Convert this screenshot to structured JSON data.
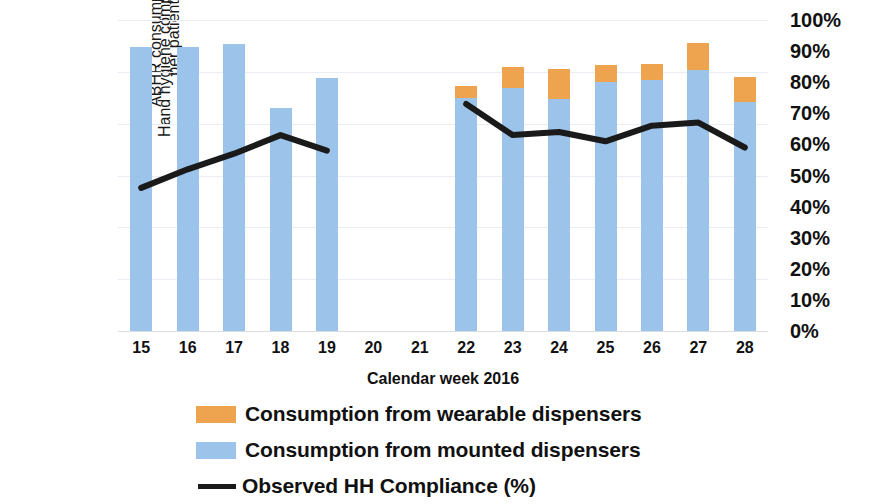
{
  "chart_data": {
    "type": "bar",
    "title": "",
    "xlabel": "Calendar week 2016",
    "categories": [
      "15",
      "16",
      "17",
      "18",
      "19",
      "20",
      "21",
      "22",
      "23",
      "24",
      "25",
      "26",
      "27",
      "28"
    ],
    "left_axis": {
      "label": "ABHR consumption in ml per patient entry",
      "label_line1": "ABHR consumption in ml",
      "label_line2": "per patient entry",
      "ticks": [
        "0",
        "5",
        "10",
        "15",
        "20",
        "25",
        "30"
      ],
      "tick_values": [
        0,
        5,
        10,
        15,
        20,
        25,
        30
      ],
      "ylim": [
        0,
        30
      ]
    },
    "right_axis": {
      "label": "Hand hygiene compliance",
      "ticks": [
        "0%",
        "10%",
        "20%",
        "30%",
        "40%",
        "50%",
        "60%",
        "70%",
        "80%",
        "90%",
        "100%"
      ],
      "tick_values": [
        0,
        10,
        20,
        30,
        40,
        50,
        60,
        70,
        80,
        90,
        100
      ],
      "ylim": [
        0,
        100
      ]
    },
    "grid": true,
    "legend_position": "bottom",
    "series": [
      {
        "name": "Consumption from wearable dispensers",
        "type": "bar-stack-top",
        "color": "#eea44f",
        "axis": "left",
        "values": [
          0,
          0,
          0,
          0,
          0,
          null,
          null,
          1.1,
          2.1,
          2.9,
          1.7,
          1.6,
          2.6,
          2.4
        ]
      },
      {
        "name": "Consumption from mounted dispensers",
        "type": "bar-stack-bottom",
        "color": "#9cc3ea",
        "axis": "left",
        "values": [
          27.4,
          27.4,
          27.7,
          21.5,
          24.4,
          null,
          null,
          22.5,
          23.4,
          22.4,
          24.0,
          24.2,
          25.2,
          22.1
        ]
      },
      {
        "name": "Observed HH Compliance (%)",
        "type": "line",
        "color": "#1a1a1a",
        "axis": "right",
        "values": [
          46,
          52,
          57,
          63,
          58,
          null,
          null,
          73,
          63,
          64,
          61,
          66,
          67,
          59
        ]
      }
    ]
  },
  "legend": {
    "items": [
      {
        "swatch": "orange-swatch",
        "label": "Consumption from wearable dispensers"
      },
      {
        "swatch": "blue-swatch",
        "label": "Consumption from mounted dispensers"
      },
      {
        "swatch": "black-line-swatch",
        "label": "Observed HH Compliance (%)"
      }
    ]
  },
  "colors": {
    "wearable": "#eea44f",
    "mounted": "#9cc3ea",
    "line": "#1a1a1a",
    "gridline": "#e9eef4",
    "text": "#111111"
  }
}
